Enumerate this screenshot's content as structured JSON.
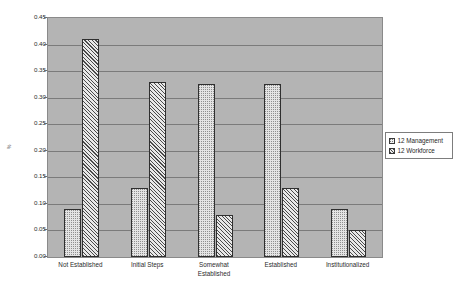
{
  "chart_data": {
    "type": "bar",
    "title": "",
    "subtitle": "",
    "xlabel": "",
    "ylabel": "%",
    "ylim": [
      0,
      0.45
    ],
    "ytick_values": [
      0.45,
      0.4,
      0.35,
      0.3,
      0.25,
      0.2,
      0.15,
      0.1,
      0.05,
      0.0
    ],
    "ytick_labels": [
      "0.45",
      "0.40",
      "0.35",
      "0.30",
      "0.25",
      "0.20",
      "0.15",
      "0.10",
      "0.05",
      "0.00"
    ],
    "grid": true,
    "grid_axis": "y",
    "legend_position": "right",
    "categories": [
      "Not Established",
      "Initial Steps",
      "Somewhat\nEstablished",
      "Established",
      "Institutionalized"
    ],
    "series": [
      {
        "name": "12 Management",
        "pattern": "dotted",
        "values": [
          0.09,
          0.13,
          0.325,
          0.325,
          0.09
        ]
      },
      {
        "name": "12 Workforce",
        "pattern": "diagonal-hatch",
        "values": [
          0.41,
          0.33,
          0.08,
          0.13,
          0.05
        ]
      }
    ],
    "colors": {
      "plot_background": "#b4b4b4",
      "page_background": "#ffffff",
      "gridline": "#7b7b7b",
      "axis": "#8a8a8a",
      "bar_outline": "#2f2f2f",
      "management_fill": "#e4e4e4",
      "workforce_fill": "#dcdcdc",
      "text": "#2b2b2b"
    }
  },
  "legend": {
    "entries": [
      {
        "label": "12 Management"
      },
      {
        "label": "12 Workforce"
      }
    ]
  }
}
